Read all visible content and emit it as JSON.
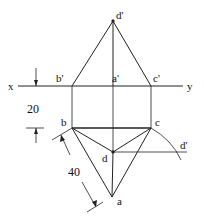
{
  "diagram": {
    "type": "orthographic-projection",
    "axis": {
      "left_label": "x",
      "right_label": "y"
    },
    "front_view_labels": {
      "apex": "d'",
      "left": "b'",
      "middle": "a'",
      "right": "c'"
    },
    "top_view_labels": {
      "left": "b",
      "right": "c",
      "center": "d",
      "bottom": "a",
      "rotated_point": "d'"
    },
    "dimensions": {
      "vertical_offset": "20",
      "edge_length": "40"
    },
    "colors": {
      "line": "#222222",
      "background": "#ffffff"
    }
  }
}
